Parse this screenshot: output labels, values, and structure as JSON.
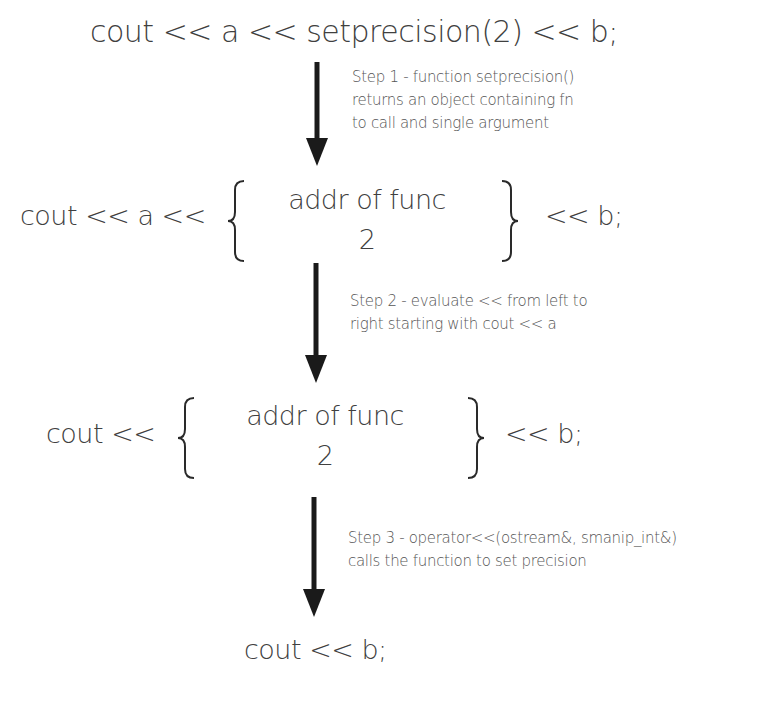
{
  "diagram": {
    "stage1": {
      "expression": "cout << a << setprecision(2) << b;"
    },
    "step1": {
      "lines": [
        "Step 1 - function setprecision()",
        "returns an object containing fn",
        "to call and single argument"
      ]
    },
    "stage2": {
      "left": "cout << a <<",
      "object_line1": "addr of func",
      "object_line2": "2",
      "right": "<< b;"
    },
    "step2": {
      "lines": [
        "Step 2 - evaluate << from left to",
        "right starting with cout << a"
      ]
    },
    "stage3": {
      "left": "cout <<",
      "object_line1": "addr of func",
      "object_line2": "2",
      "right": "<< b;"
    },
    "step3": {
      "lines": [
        "Step 3 - operator<<(ostream&, smanip_int&)",
        "calls the function to set precision"
      ]
    },
    "stage4": {
      "expression": "cout << b;"
    },
    "colors": {
      "text": "#404040",
      "arrow": "#1a1a1a",
      "background": "#ffffff"
    }
  }
}
